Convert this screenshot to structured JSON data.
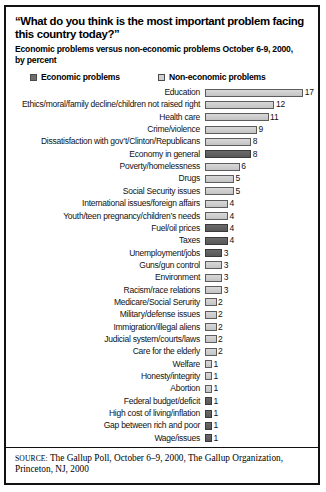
{
  "figure": {
    "title": "“What do you think is the most important problem facing this country today?”",
    "subtitle_line1": "Economic problems versus non-economic problems October 6-9, 2000,",
    "subtitle_line2": "by percent",
    "legend": {
      "economic_label": "Economic problems",
      "noneconomic_label": "Non-economic problems"
    },
    "source_label": "SOURCE:",
    "source_line1": " The Gallup Poll, October 6–9, 2000, The Gallup Organization,",
    "source_line2": "Princeton, NJ, 2000"
  },
  "colors": {
    "economic_bar": "#5f5f5f",
    "noneconomic_bar": "#cfcfcf",
    "bar_border": "#5c5c5c",
    "text": "#111111",
    "frame": "#111111"
  },
  "chart_data": {
    "type": "bar",
    "orientation": "horizontal",
    "title": "“What do you think is the most important problem facing this country today?”",
    "subtitle": "Economic problems versus non-economic problems October 6-9, 2000, by percent",
    "xlabel": "",
    "ylabel": "",
    "xlim": [
      0,
      17
    ],
    "grid": false,
    "legend_position": "top",
    "value_unit": "percent",
    "value_labels_shown": true,
    "series": [
      {
        "name": "Economic problems",
        "color": "#5f5f5f"
      },
      {
        "name": "Non-economic problems",
        "color": "#cfcfcf"
      }
    ],
    "categories": [
      "Education",
      "Ethics/moral/family decline/children not raised right",
      "Health care",
      "Crime/violence",
      "Dissatisfaction with gov’t/Clinton/Republicans",
      "Economy in general",
      "Poverty/homelessness",
      "Drugs",
      "Social Security issues",
      "International issues/foreign affairs",
      "Youth/teen pregnancy/children’s needs",
      "Fuel/oil prices",
      "Taxes",
      "Unemployment/jobs",
      "Guns/gun control",
      "Environment",
      "Racism/race relations",
      "Medicare/Social Serurity",
      "Military/defense issues",
      "Immigration/illegal aliens",
      "Judicial system/courts/laws",
      "Care for the elderly",
      "Welfare",
      "Honesty/integrity",
      "Abortion",
      "Federal budget/deficit",
      "High cost of living/inflation",
      "Gap between rich and poor",
      "Wage/issues"
    ],
    "values": [
      17,
      12,
      11,
      9,
      8,
      8,
      6,
      5,
      5,
      4,
      4,
      4,
      4,
      3,
      3,
      3,
      3,
      2,
      2,
      2,
      2,
      2,
      1,
      1,
      1,
      1,
      1,
      1,
      1
    ],
    "types": [
      "non-economic",
      "non-economic",
      "non-economic",
      "non-economic",
      "non-economic",
      "economic",
      "non-economic",
      "non-economic",
      "non-economic",
      "non-economic",
      "non-economic",
      "economic",
      "economic",
      "economic",
      "non-economic",
      "non-economic",
      "non-economic",
      "non-economic",
      "non-economic",
      "non-economic",
      "non-economic",
      "non-economic",
      "non-economic",
      "non-economic",
      "non-economic",
      "economic",
      "economic",
      "economic",
      "economic"
    ],
    "rows": [
      {
        "label": "Education",
        "value": 17,
        "type": "non-economic"
      },
      {
        "label": "Ethics/moral/family decline/children not raised right",
        "value": 12,
        "type": "non-economic"
      },
      {
        "label": "Health care",
        "value": 11,
        "type": "non-economic"
      },
      {
        "label": "Crime/violence",
        "value": 9,
        "type": "non-economic"
      },
      {
        "label": "Dissatisfaction with gov’t/Clinton/Republicans",
        "value": 8,
        "type": "non-economic"
      },
      {
        "label": "Economy in general",
        "value": 8,
        "type": "economic"
      },
      {
        "label": "Poverty/homelessness",
        "value": 6,
        "type": "non-economic"
      },
      {
        "label": "Drugs",
        "value": 5,
        "type": "non-economic"
      },
      {
        "label": "Social Security issues",
        "value": 5,
        "type": "non-economic"
      },
      {
        "label": "International issues/foreign affairs",
        "value": 4,
        "type": "non-economic"
      },
      {
        "label": "Youth/teen pregnancy/children’s needs",
        "value": 4,
        "type": "non-economic"
      },
      {
        "label": "Fuel/oil prices",
        "value": 4,
        "type": "economic"
      },
      {
        "label": "Taxes",
        "value": 4,
        "type": "economic"
      },
      {
        "label": "Unemployment/jobs",
        "value": 3,
        "type": "economic"
      },
      {
        "label": "Guns/gun control",
        "value": 3,
        "type": "non-economic"
      },
      {
        "label": "Environment",
        "value": 3,
        "type": "non-economic"
      },
      {
        "label": "Racism/race relations",
        "value": 3,
        "type": "non-economic"
      },
      {
        "label": "Medicare/Social Serurity",
        "value": 2,
        "type": "non-economic"
      },
      {
        "label": "Military/defense issues",
        "value": 2,
        "type": "non-economic"
      },
      {
        "label": "Immigration/illegal aliens",
        "value": 2,
        "type": "non-economic"
      },
      {
        "label": "Judicial system/courts/laws",
        "value": 2,
        "type": "non-economic"
      },
      {
        "label": "Care for the elderly",
        "value": 2,
        "type": "non-economic"
      },
      {
        "label": "Welfare",
        "value": 1,
        "type": "non-economic"
      },
      {
        "label": "Honesty/integrity",
        "value": 1,
        "type": "non-economic"
      },
      {
        "label": "Abortion",
        "value": 1,
        "type": "non-economic"
      },
      {
        "label": "Federal budget/deficit",
        "value": 1,
        "type": "economic"
      },
      {
        "label": "High cost of living/inflation",
        "value": 1,
        "type": "economic"
      },
      {
        "label": "Gap between rich and poor",
        "value": 1,
        "type": "economic"
      },
      {
        "label": "Wage/issues",
        "value": 1,
        "type": "economic"
      }
    ]
  }
}
